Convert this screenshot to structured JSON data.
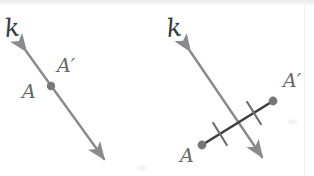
{
  "canvas": {
    "width": 314,
    "height": 176,
    "background": "#ffffff"
  },
  "colors": {
    "line_gray": "#8a8a8a",
    "segment_dark": "#3d3d3d",
    "point_gray": "#777777",
    "label_gray": "#6b6b6b",
    "label_dark": "#3a3a3a",
    "band_gray": "#ececec"
  },
  "figures": [
    {
      "id": "figure-left",
      "name": "reflection-point-on-line",
      "line": {
        "name": "line-k",
        "label": "k",
        "label_pos": {
          "x": 6,
          "y": 16
        },
        "arrow_start": {
          "x": 26,
          "y": 51
        },
        "arrow_end": {
          "x": 104,
          "y": 159
        },
        "double_headed": true,
        "color": "#8a8a8a",
        "width": 2.4
      },
      "points": [
        {
          "name": "point-A",
          "label": "A",
          "label_pos": {
            "x": 22,
            "y": 82
          },
          "dot": null
        },
        {
          "name": "point-A-prime",
          "label": "A′",
          "label_pos": {
            "x": 57,
            "y": 56
          },
          "dot": {
            "x": 51,
            "y": 86,
            "r": 4.2,
            "color": "#777777"
          }
        }
      ],
      "ticks": []
    },
    {
      "id": "figure-right",
      "name": "perpendicular-bisector-construction",
      "line": {
        "name": "line-k",
        "label": "k",
        "label_pos": {
          "x": 168,
          "y": 16
        },
        "arrow_start": {
          "x": 190,
          "y": 51
        },
        "arrow_end": {
          "x": 262,
          "y": 157
        },
        "double_headed": true,
        "color": "#8a8a8a",
        "width": 2.4
      },
      "segment": {
        "name": "segment-A-Aprime",
        "from": {
          "x": 202,
          "y": 145
        },
        "to": {
          "x": 273,
          "y": 101
        },
        "color": "#3d3d3d",
        "width": 2.6
      },
      "points": [
        {
          "name": "point-A",
          "label": "A",
          "label_pos": {
            "x": 180,
            "y": 146
          },
          "dot": {
            "x": 202,
            "y": 145,
            "r": 4.4,
            "color": "#777777"
          }
        },
        {
          "name": "point-A-prime",
          "label": "A′",
          "label_pos": {
            "x": 283,
            "y": 71
          },
          "dot": {
            "x": 273,
            "y": 101,
            "r": 4.4,
            "color": "#777777"
          }
        }
      ],
      "ticks": [
        {
          "name": "congruence-tick-left",
          "cx": 220,
          "cy": 134,
          "len": 13,
          "angle_deg": 58
        },
        {
          "name": "congruence-tick-right",
          "cx": 254,
          "cy": 113,
          "len": 13,
          "angle_deg": 58
        }
      ]
    }
  ],
  "artifacts": {
    "top_band_height": 6,
    "seam_x": 304,
    "smudges": [
      {
        "name": "scan-smudge-1",
        "x": 288,
        "y": 120,
        "w": 9,
        "h": 4
      },
      {
        "name": "scan-smudge-2",
        "x": 137,
        "y": 166,
        "w": 10,
        "h": 4
      }
    ]
  }
}
